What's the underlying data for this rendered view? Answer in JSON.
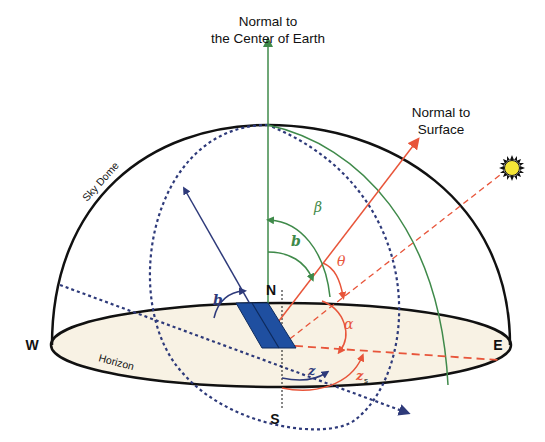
{
  "diagram": {
    "title_labels": {
      "normal_earth": [
        "Normal to",
        "the Center of Earth"
      ],
      "normal_surface": [
        "Normal to",
        "Surface"
      ],
      "sky_dome": "Sky Dome",
      "horizon": "Horizon"
    },
    "compass": {
      "north": "N",
      "south": "S",
      "east": "E",
      "west": "W"
    },
    "angles": {
      "beta": "β",
      "b_upper": "b",
      "theta": "θ",
      "b_left": "b",
      "alpha": "α",
      "z": "z",
      "zs_main": "z",
      "zs_sub": "s"
    },
    "icons": {
      "sun": "sun-icon",
      "solar_panel": "solar-panel-icon"
    },
    "colors": {
      "green": "#3f8a4a",
      "red": "#e8553a",
      "navy": "#2e3a7a",
      "panel": "#1f4fa0",
      "horizon_fill": "#f8f2e4",
      "sun_fill": "#f5e637",
      "outline": "#111111"
    }
  }
}
